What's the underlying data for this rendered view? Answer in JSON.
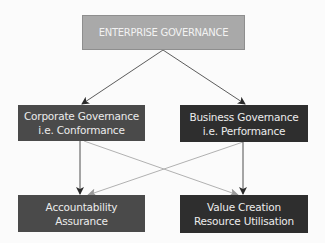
{
  "diagram": {
    "type": "hierarchy",
    "nodes": {
      "top": {
        "lines": [
          "ENTERPRISE GOVERNANCE"
        ],
        "fill": "#a9a9a9"
      },
      "corporate": {
        "lines": [
          "Corporate Governance",
          "i.e. Conformance"
        ],
        "fill": "#4a4a4a"
      },
      "business": {
        "lines": [
          "Business Governance",
          "i.e. Performance"
        ],
        "fill": "#2e2e2e"
      },
      "accountability": {
        "lines": [
          "Accountability",
          "Assurance"
        ],
        "fill": "#4a4a4a"
      },
      "value": {
        "lines": [
          "Value Creation",
          "Resource Utilisation"
        ],
        "fill": "#2e2e2e"
      }
    },
    "edges": [
      {
        "from": "top",
        "to": "corporate",
        "style": "dark"
      },
      {
        "from": "top",
        "to": "business",
        "style": "dark"
      },
      {
        "from": "corporate",
        "to": "accountability",
        "style": "dark"
      },
      {
        "from": "business",
        "to": "value",
        "style": "dark"
      },
      {
        "from": "corporate",
        "to": "value",
        "style": "light"
      },
      {
        "from": "business",
        "to": "accountability",
        "style": "light"
      }
    ],
    "colors": {
      "background": "#fbfbfb",
      "dark_edge": "#3a3a3a",
      "light_edge": "#a8a8a8",
      "box_text": "#ececec"
    }
  }
}
